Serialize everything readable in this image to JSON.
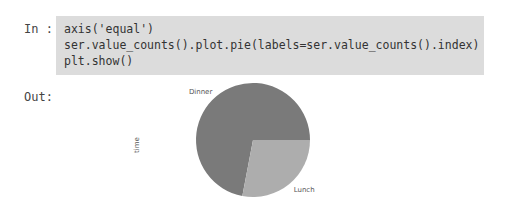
{
  "cell": {
    "in_prompt": "In :",
    "out_prompt": "Out:",
    "code_lines": [
      "axis('equal')",
      "ser.value_counts().plot.pie(labels=ser.value_counts().index)",
      "plt.show()"
    ]
  },
  "chart_data": {
    "type": "pie",
    "labels": [
      "Dinner",
      "Lunch"
    ],
    "values": [
      72,
      28
    ],
    "colors": [
      "#7a7a7a",
      "#adadad"
    ],
    "ylabel": "time",
    "title": ""
  }
}
